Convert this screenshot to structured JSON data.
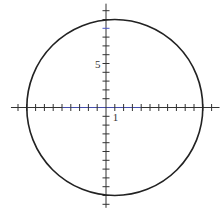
{
  "chart_data": {
    "type": "line",
    "title": "",
    "xlabel": "",
    "ylabel": "",
    "shape": {
      "kind": "circle",
      "center": [
        1,
        0
      ],
      "radius": 10,
      "equation": "(x-1)^2 + y^2 = 100"
    },
    "x_axis": {
      "range": [
        -10.8,
        12.9
      ],
      "ticks": [
        -10,
        -9,
        -8,
        -7,
        -6,
        -5,
        -4,
        -3,
        -2,
        -1,
        1,
        2,
        3,
        4,
        5,
        6,
        7,
        8,
        9,
        10,
        11,
        12
      ],
      "labeled_ticks": [
        1
      ]
    },
    "y_axis": {
      "range": [
        -11.4,
        11.8
      ],
      "ticks": [
        -11,
        -10,
        -9,
        -8,
        -7,
        -6,
        -5,
        -4,
        -3,
        -2,
        -1,
        1,
        2,
        3,
        4,
        5,
        6,
        7,
        8,
        9,
        10,
        11
      ],
      "labeled_ticks": [
        5
      ]
    },
    "grid": false,
    "legend": null
  },
  "labels": {
    "x_tick_label": "1",
    "y_tick_label": "5"
  },
  "colors": {
    "curve": "#222222",
    "axis": "#333333",
    "axis_center_tint": "#4a55c8",
    "background": "#ffffff"
  },
  "layout": {
    "origin_px": [
      106,
      107.5
    ],
    "px_per_unit": 8.8
  }
}
